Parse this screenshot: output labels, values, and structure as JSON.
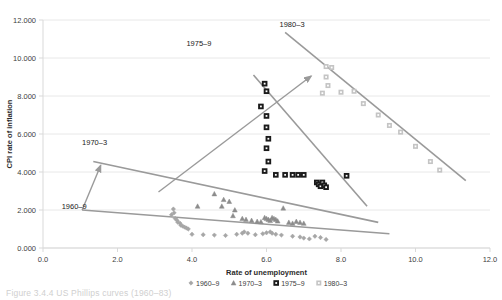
{
  "figure": {
    "caption": "Figure 3.4.4 US Phillips curves (1960–83)"
  },
  "chart_data": {
    "type": "scatter",
    "title": "",
    "xlabel": "Rate of unemployment",
    "ylabel": "CPI rate of inflation",
    "xlim": [
      0.0,
      12.0
    ],
    "ylim": [
      0.0,
      12.0
    ],
    "xticks": [
      "0.0",
      "2.0",
      "4.0",
      "6.0",
      "8.0",
      "10.0",
      "12.0"
    ],
    "yticks": [
      "0.000",
      "2.000",
      "4.000",
      "6.000",
      "8.000",
      "10.000",
      "12.000"
    ],
    "xtick_values": [
      0,
      2,
      4,
      6,
      8,
      10,
      12
    ],
    "ytick_values": [
      0,
      2,
      4,
      6,
      8,
      10,
      12
    ],
    "grid": "horizontal",
    "legend_position": "bottom",
    "series": [
      {
        "name": "1960–9",
        "marker": "diamond",
        "color": "#a6a6a6",
        "points": [
          [
            3.45,
            1.75
          ],
          [
            3.5,
            2.05
          ],
          [
            3.52,
            1.85
          ],
          [
            3.55,
            1.55
          ],
          [
            3.6,
            1.45
          ],
          [
            3.62,
            1.35
          ],
          [
            3.68,
            1.3
          ],
          [
            3.7,
            1.2
          ],
          [
            3.75,
            1.15
          ],
          [
            3.8,
            1.1
          ],
          [
            3.85,
            1.05
          ],
          [
            3.9,
            1.0
          ],
          [
            4.0,
            0.72
          ],
          [
            4.3,
            0.7
          ],
          [
            4.6,
            0.68
          ],
          [
            4.9,
            0.66
          ],
          [
            5.2,
            0.72
          ],
          [
            5.35,
            0.78
          ],
          [
            5.4,
            0.85
          ],
          [
            5.5,
            0.78
          ],
          [
            5.7,
            0.7
          ],
          [
            5.9,
            0.75
          ],
          [
            6.0,
            0.8
          ],
          [
            6.1,
            0.85
          ],
          [
            6.15,
            0.78
          ],
          [
            6.25,
            0.72
          ],
          [
            6.4,
            0.68
          ],
          [
            6.7,
            0.62
          ],
          [
            6.9,
            0.58
          ],
          [
            7.0,
            0.52
          ],
          [
            7.15,
            0.48
          ],
          [
            7.3,
            0.62
          ],
          [
            7.45,
            0.55
          ],
          [
            7.6,
            0.45
          ]
        ]
      },
      {
        "name": "1970–3",
        "marker": "triangle",
        "color": "#8c8c8c",
        "points": [
          [
            4.15,
            2.2
          ],
          [
            4.6,
            2.85
          ],
          [
            4.8,
            2.2
          ],
          [
            4.85,
            2.55
          ],
          [
            5.0,
            2.45
          ],
          [
            5.1,
            1.7
          ],
          [
            5.15,
            2.0
          ],
          [
            5.35,
            1.55
          ],
          [
            5.45,
            1.5
          ],
          [
            5.6,
            1.45
          ],
          [
            5.75,
            1.4
          ],
          [
            5.85,
            1.38
          ],
          [
            5.95,
            1.6
          ],
          [
            6.0,
            1.55
          ],
          [
            6.05,
            1.5
          ],
          [
            6.1,
            1.45
          ],
          [
            6.15,
            1.6
          ],
          [
            6.2,
            1.55
          ],
          [
            6.25,
            1.5
          ],
          [
            6.3,
            1.42
          ],
          [
            6.45,
            2.1
          ],
          [
            6.6,
            1.35
          ],
          [
            6.7,
            1.3
          ],
          [
            6.8,
            1.4
          ],
          [
            6.9,
            1.35
          ],
          [
            7.0,
            1.3
          ]
        ]
      },
      {
        "name": "1975–9",
        "marker": "square-filled",
        "color": "#262626",
        "points": [
          [
            5.95,
            8.65
          ],
          [
            6.0,
            8.25
          ],
          [
            5.85,
            7.45
          ],
          [
            6.0,
            6.95
          ],
          [
            6.0,
            6.35
          ],
          [
            6.05,
            5.75
          ],
          [
            6.0,
            5.25
          ],
          [
            6.05,
            4.55
          ],
          [
            5.95,
            4.05
          ],
          [
            6.25,
            3.85
          ],
          [
            6.5,
            3.85
          ],
          [
            6.7,
            3.85
          ],
          [
            6.85,
            3.85
          ],
          [
            7.0,
            3.85
          ],
          [
            7.35,
            3.45
          ],
          [
            7.4,
            3.35
          ],
          [
            7.45,
            3.25
          ],
          [
            7.5,
            3.45
          ],
          [
            7.55,
            3.3
          ],
          [
            7.6,
            3.2
          ],
          [
            8.15,
            3.8
          ]
        ]
      },
      {
        "name": "1980–3",
        "marker": "square-light",
        "color": "#c4c4c4",
        "points": [
          [
            7.6,
            9.55
          ],
          [
            7.75,
            9.5
          ],
          [
            7.6,
            9.0
          ],
          [
            7.65,
            8.55
          ],
          [
            7.5,
            8.15
          ],
          [
            8.0,
            8.2
          ],
          [
            8.35,
            8.25
          ],
          [
            8.6,
            7.6
          ],
          [
            9.0,
            7.0
          ],
          [
            9.3,
            6.45
          ],
          [
            9.6,
            6.1
          ],
          [
            10.0,
            5.35
          ],
          [
            10.4,
            4.55
          ],
          [
            10.65,
            4.1
          ]
        ]
      }
    ],
    "annotations": [
      {
        "label": "1975–9",
        "x": 3.85,
        "y": 10.65
      },
      {
        "label": "1980–3",
        "x": 6.35,
        "y": 11.65
      },
      {
        "label": "1970–3",
        "x": 1.05,
        "y": 5.4
      },
      {
        "label": "1960–9",
        "x": 0.5,
        "y": 2.05
      }
    ],
    "trend_lines": [
      {
        "name": "1960-9-trend",
        "x1": 1.05,
        "y1": 2.0,
        "x2": 9.3,
        "y2": 0.75
      },
      {
        "name": "1970-3-trend",
        "x1": 1.35,
        "y1": 4.55,
        "x2": 9.0,
        "y2": 1.35
      },
      {
        "name": "1975-9-trend",
        "x1": 5.65,
        "y1": 9.1,
        "x2": 8.7,
        "y2": 2.2
      },
      {
        "name": "1980-3-trend",
        "x1": 6.5,
        "y1": 11.35,
        "x2": 11.35,
        "y2": 3.55
      }
    ],
    "shift_arrows": [
      {
        "name": "arrow-1960-to-1970",
        "x1": 1.05,
        "y1": 2.0,
        "x2": 1.55,
        "y2": 4.35
      },
      {
        "name": "arrow-1970-to-1975",
        "x1": 3.1,
        "y1": 2.95,
        "x2": 7.2,
        "y2": 9.05
      }
    ]
  },
  "legend": {
    "items": [
      {
        "label": "1960–9",
        "marker": "diamond",
        "color": "#a6a6a6"
      },
      {
        "label": "1970–3",
        "marker": "triangle",
        "color": "#8c8c8c"
      },
      {
        "label": "1975–9",
        "marker": "square-filled",
        "color": "#262626"
      },
      {
        "label": "1980–3",
        "marker": "square-light",
        "color": "#c4c4c4"
      }
    ]
  }
}
